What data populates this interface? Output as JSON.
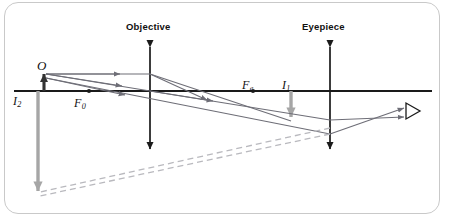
{
  "figure": {
    "kind": "optical-ray-diagram",
    "frame": {
      "border_color": "#c9c9c9",
      "background": "#ffffff",
      "corner_radius_px": 14
    }
  },
  "colors": {
    "axis": "#1a1a1a",
    "lens": "#1a1a1a",
    "object_arrow": "#333333",
    "image_arrow_gray": "#a6a6a6",
    "ray": "#6e6e77",
    "ray_dashed": "#b9b9be",
    "label_text": "#111111",
    "frame_border": "#c9c9c9"
  },
  "labels": {
    "objective": "Objective",
    "eyepiece": "Eyepiece",
    "object": "O",
    "image_two_base": "I",
    "image_two_sub": "2",
    "focal_objective_base": "F",
    "focal_objective_sub": "0",
    "focal_eyepiece_base": "F",
    "focal_eyepiece_sub": "e",
    "image_one_base": "I",
    "image_one_sub": "1"
  },
  "geometry": {
    "optical_axis": {
      "x1": 14,
      "y1": 91,
      "x2": 432,
      "y2": 91
    },
    "objective_lens": {
      "x": 150,
      "y_top": 41,
      "y_bottom": 155
    },
    "eyepiece_lens": {
      "x": 330,
      "y_top": 41,
      "y_bottom": 155
    },
    "object_arrow": {
      "x": 44,
      "y_base": 91,
      "y_tip": 72
    },
    "image_one_arrow": {
      "x": 291,
      "y_base": 91,
      "y_tip": 121
    },
    "image_two_arrow": {
      "x": 38,
      "y_base": 91,
      "y_tip": 196
    },
    "focal_point_objective": {
      "x": 89,
      "y": 91
    },
    "focal_point_eyepiece": {
      "x": 253,
      "y": 91
    },
    "eye_symbol": {
      "x": 412,
      "y": 110,
      "size": 14
    },
    "ray_converge_point": {
      "x": 291,
      "y": 121
    },
    "ray_eyepiece_hit": {
      "x": 330,
      "y": 131
    },
    "virtual_image_foot": {
      "x": 38,
      "y": 196
    }
  },
  "rays": {
    "parallel_ray_label": "parallel-ray-through-objective",
    "center_ray_label": "chief-ray-through-objective-center",
    "refracted_rays_label": "rays-refracted-by-eyepiece",
    "virtual_extension_label": "virtual-image-construction-lines"
  }
}
